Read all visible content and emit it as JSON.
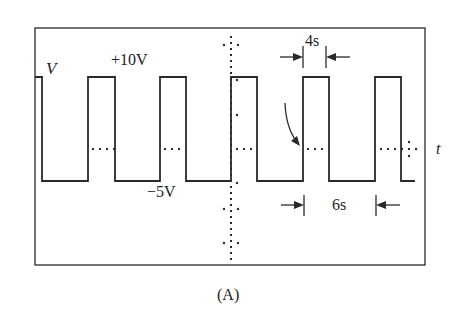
{
  "figure": {
    "caption": "(A)",
    "axis_labels": {
      "y": "V",
      "x": "t"
    },
    "annotations": {
      "high_level": "+10V",
      "low_level": "−5V",
      "pulse_width": "4s",
      "low_duration": "6s"
    },
    "colors": {
      "stroke": "#2a2a2a",
      "background": "#ffffff"
    }
  },
  "waveform": {
    "type": "square-wave",
    "high_voltage": 10,
    "low_voltage": -5,
    "high_duration_s": 4,
    "low_duration_s": 6,
    "period_s": 10
  }
}
